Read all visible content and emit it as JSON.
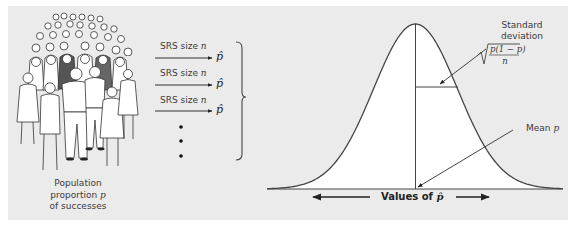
{
  "figure": {
    "population": {
      "illustration": "crowd-of-people",
      "caption_line1": "Population",
      "caption_line2_prefix": "proportion ",
      "caption_line2_symbol": "p",
      "caption_line3": "of successes"
    },
    "samples": [
      {
        "label_prefix": "SRS size ",
        "label_symbol": "n",
        "result": "p̂"
      },
      {
        "label_prefix": "SRS size ",
        "label_symbol": "n",
        "result": "p̂"
      },
      {
        "label_prefix": "SRS size ",
        "label_symbol": "n",
        "result": "p̂"
      }
    ],
    "continuation": "⋮",
    "distribution": {
      "sd_label_line1": "Standard",
      "sd_label_line2": "deviation",
      "sd_formula_numerator": "p(1 − p)",
      "sd_formula_denominator": "n",
      "mean_label_prefix": "Mean ",
      "mean_label_symbol": "p",
      "axis_label_prefix": "Values of ",
      "axis_label_symbol": "p̂"
    },
    "colors": {
      "panel_background": "#ebebeb",
      "curve_fill": "#ffffff",
      "line": "#444444",
      "text": "#3a3a3a"
    }
  }
}
